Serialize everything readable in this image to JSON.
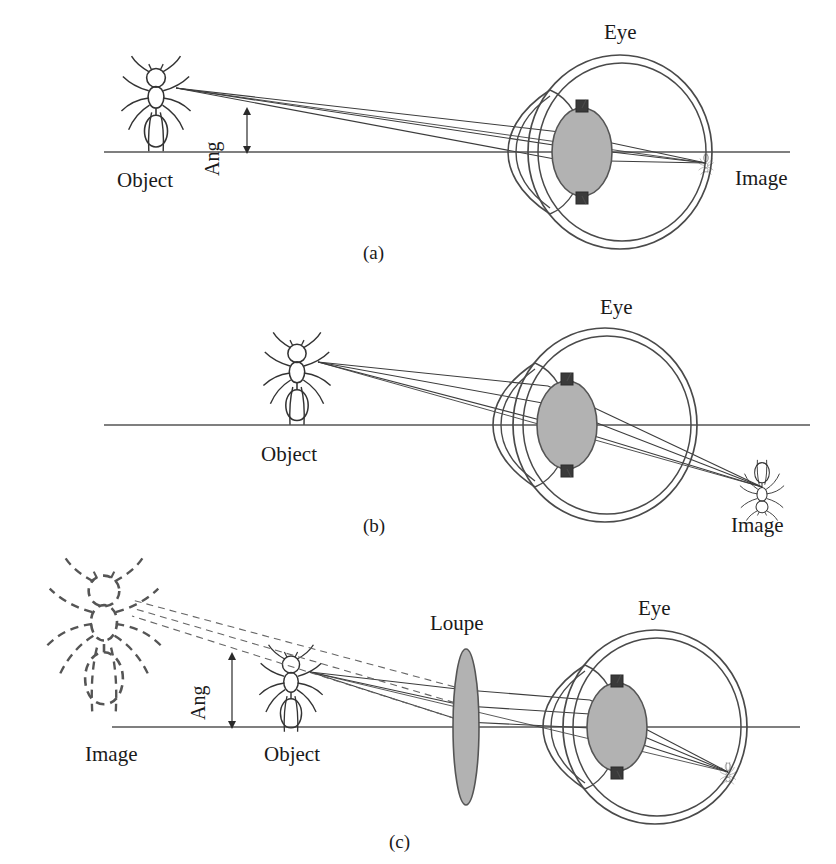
{
  "figure": {
    "panels": [
      {
        "id": "a",
        "caption": "(a)",
        "description": "Distant object viewed by unaided eye; small retinal image",
        "labels": {
          "object": "Object",
          "eye": "Eye",
          "image": "Image",
          "angle": "Ang"
        }
      },
      {
        "id": "b",
        "caption": "(b)",
        "description": "Object brought closer to the eye; larger but unfocused image",
        "labels": {
          "object": "Object",
          "eye": "Eye",
          "image": "Image"
        }
      },
      {
        "id": "c",
        "caption": "(c)",
        "description": "Loupe placed between object and eye forms enlarged virtual image",
        "labels": {
          "object": "Object",
          "eye": "Eye",
          "image": "Image",
          "loupe": "Loupe",
          "angle": "Ang"
        }
      }
    ]
  },
  "colors": {
    "ink": "#1a1a1a",
    "line": "#4a4a4a",
    "lens_fill": "#b2b2b2",
    "lens_stroke": "#555555",
    "iris": "#3a3a3a",
    "background": "#ffffff"
  },
  "layout": {
    "width": 836,
    "height": 864,
    "panel_a": {
      "axis_y": 152,
      "object_x": 165,
      "eye_cx": 620,
      "eye_r": 95,
      "caption_x": 372,
      "caption_y": 247
    },
    "panel_b": {
      "axis_y": 425,
      "object_x": 307,
      "eye_cx": 605,
      "eye_r": 95,
      "caption_x": 372,
      "caption_y": 520
    },
    "panel_c": {
      "axis_y": 727,
      "image_x": 118,
      "object_x": 300,
      "loupe_x": 466,
      "eye_cx": 655,
      "eye_r": 90,
      "caption_x": 398,
      "caption_y": 836
    }
  }
}
